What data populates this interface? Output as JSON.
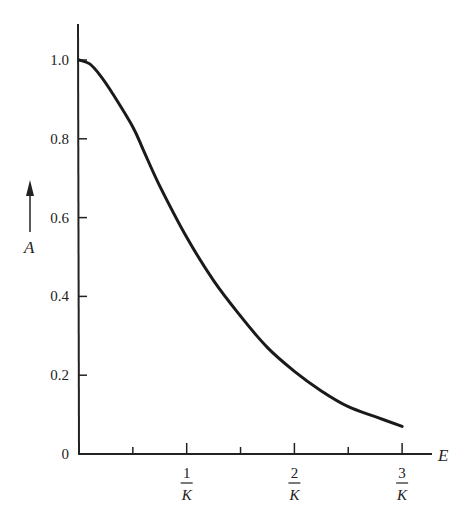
{
  "chart_data": {
    "type": "line",
    "title": "",
    "xlabel": "E",
    "ylabel": "A",
    "xlim": [
      0,
      3.2
    ],
    "ylim": [
      0,
      1.1
    ],
    "grid": false,
    "legend": null,
    "y_ticks": [
      {
        "value": 0,
        "label": "0"
      },
      {
        "value": 0.2,
        "label": "0.2"
      },
      {
        "value": 0.4,
        "label": "0.4"
      },
      {
        "value": 0.6,
        "label": "0.6"
      },
      {
        "value": 0.8,
        "label": "0.8"
      },
      {
        "value": 1.0,
        "label": "1.0"
      }
    ],
    "x_ticks": [
      {
        "value": 0.5,
        "label": "",
        "minor": true
      },
      {
        "value": 1,
        "num": "1",
        "den": "K"
      },
      {
        "value": 1.5,
        "label": "",
        "minor": true
      },
      {
        "value": 2,
        "num": "2",
        "den": "K"
      },
      {
        "value": 2.5,
        "label": "",
        "minor": true
      },
      {
        "value": 3,
        "num": "3",
        "den": "K"
      }
    ],
    "x_tick_unit": "1/K",
    "series": [
      {
        "name": "A(E)",
        "x": [
          0,
          0.1,
          0.2,
          0.3,
          0.5,
          0.6,
          0.75,
          1.0,
          1.25,
          1.5,
          1.75,
          2.0,
          2.25,
          2.5,
          2.75,
          3.0
        ],
        "y": [
          1.0,
          0.99,
          0.96,
          0.92,
          0.83,
          0.77,
          0.68,
          0.55,
          0.44,
          0.35,
          0.27,
          0.21,
          0.16,
          0.12,
          0.095,
          0.07
        ]
      }
    ]
  }
}
